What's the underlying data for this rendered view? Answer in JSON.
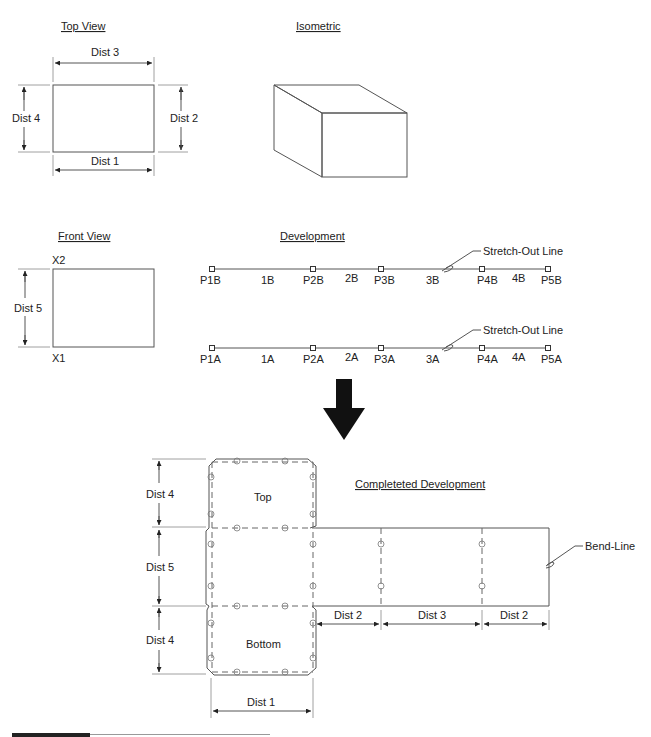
{
  "top_view": {
    "title": "Top View",
    "dim_top": "Dist 3",
    "dim_left": "Dist 4",
    "dim_right": "Dist 2",
    "dim_bottom": "Dist 1"
  },
  "isometric": {
    "title": "Isometric"
  },
  "front_view": {
    "title": "Front View",
    "label_top": "X2",
    "label_bottom": "X1",
    "dim_left": "Dist 5"
  },
  "development": {
    "title": "Development",
    "line_b": {
      "points": [
        "P1B",
        "P2B",
        "P3B",
        "P4B",
        "P5B"
      ],
      "segments": [
        "1B",
        "2B",
        "3B",
        "4B"
      ],
      "callout": "Stretch-Out Line"
    },
    "line_a": {
      "points": [
        "P1A",
        "P2A",
        "P3A",
        "P4A",
        "P5A"
      ],
      "segments": [
        "1A",
        "2A",
        "3A",
        "4A"
      ],
      "callout": "Stretch-Out Line"
    }
  },
  "arrow": {
    "direction": "down",
    "color": "#111111"
  },
  "completed": {
    "title": "Completeted Development",
    "panel_top": "Top",
    "panel_bottom": "Bottom",
    "dims_left": [
      "Dist 4",
      "Dist 5",
      "Dist 4"
    ],
    "dims_bottom_right": [
      "Dist 2",
      "Dist 3",
      "Dist 2"
    ],
    "dim_bottom": "Dist 1",
    "callout": "Bend-Line"
  },
  "colors": {
    "line": "#555555",
    "text": "#222222",
    "background": "#ffffff"
  }
}
